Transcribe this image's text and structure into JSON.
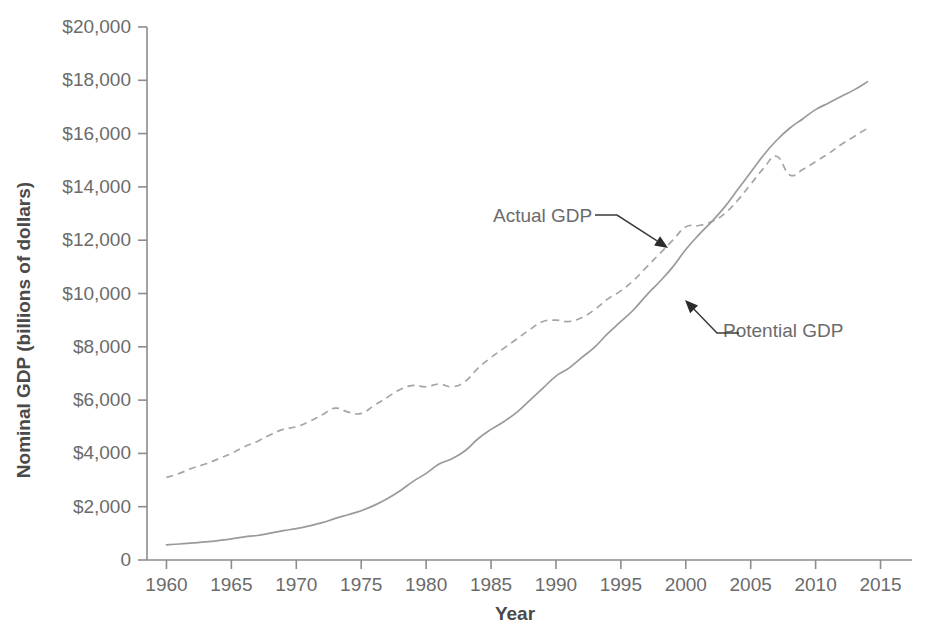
{
  "chart_data": {
    "type": "line",
    "title": "",
    "xlabel": "Year",
    "ylabel": "Nominal GDP (billions of dollars)",
    "xlim": [
      1958.5,
      2016.5
    ],
    "ylim": [
      0,
      20000
    ],
    "xticks": [
      "1960",
      "1965",
      "1970",
      "1975",
      "1980",
      "1985",
      "1990",
      "1995",
      "2000",
      "2005",
      "2010",
      "2015"
    ],
    "xtick_values": [
      1960,
      1965,
      1970,
      1975,
      1980,
      1985,
      1990,
      1995,
      2000,
      2005,
      2010,
      2015
    ],
    "yticks": [
      "0",
      "$2,000",
      "$4,000",
      "$6,000",
      "$8,000",
      "$10,000",
      "$12,000",
      "$14,000",
      "$16,000",
      "$18,000",
      "$20,000"
    ],
    "ytick_values": [
      0,
      2000,
      4000,
      6000,
      8000,
      10000,
      12000,
      14000,
      16000,
      18000,
      20000
    ],
    "grid": false,
    "legend_position": "inline-annotation",
    "x": [
      1960,
      1961,
      1962,
      1963,
      1964,
      1965,
      1966,
      1967,
      1968,
      1969,
      1970,
      1971,
      1972,
      1973,
      1974,
      1975,
      1976,
      1977,
      1978,
      1979,
      1980,
      1981,
      1982,
      1983,
      1984,
      1985,
      1986,
      1987,
      1988,
      1989,
      1990,
      1991,
      1992,
      1993,
      1994,
      1995,
      1996,
      1997,
      1998,
      1999,
      2000,
      2001,
      2002,
      2003,
      2004,
      2005,
      2006,
      2007,
      2008,
      2009,
      2010,
      2011,
      2012,
      2013,
      2014
    ],
    "series": [
      {
        "name": "Actual GDP",
        "style": "dashed",
        "color": "#a5a5a5",
        "values": [
          3100,
          3250,
          3450,
          3600,
          3800,
          4000,
          4250,
          4450,
          4700,
          4900,
          5000,
          5200,
          5450,
          5700,
          5550,
          5500,
          5800,
          6100,
          6400,
          6550,
          6500,
          6600,
          6500,
          6700,
          7200,
          7600,
          7950,
          8300,
          8650,
          8950,
          9000,
          8950,
          9100,
          9400,
          9800,
          10100,
          10500,
          11000,
          11500,
          12000,
          12500,
          12550,
          12700,
          13000,
          13500,
          14100,
          14700,
          15150,
          14450,
          14650,
          14950,
          15250,
          15600,
          15900,
          16200
        ]
      },
      {
        "name": "Potential GDP",
        "style": "solid",
        "color": "#9a9a9a",
        "values": [
          570,
          600,
          640,
          680,
          730,
          790,
          870,
          920,
          1010,
          1100,
          1180,
          1280,
          1400,
          1560,
          1700,
          1850,
          2050,
          2300,
          2600,
          2950,
          3250,
          3600,
          3800,
          4100,
          4550,
          4900,
          5200,
          5550,
          6000,
          6450,
          6900,
          7200,
          7600,
          8000,
          8500,
          8950,
          9400,
          9950,
          10450,
          11000,
          11650,
          12200,
          12700,
          13250,
          13900,
          14550,
          15200,
          15750,
          16200,
          16550,
          16900,
          17150,
          17400,
          17650,
          17950
        ]
      }
    ],
    "annotations": [
      {
        "id": "actual-gdp-annotation",
        "text": "Actual GDP",
        "label_x": 493,
        "label_y": 222,
        "leader_from_x": 617,
        "leader_from_y": 215,
        "leader_to_x": 668,
        "leader_to_y": 248
      },
      {
        "id": "potential-gdp-annotation",
        "text": "Potential GDP",
        "label_x": 723,
        "label_y": 337,
        "leader_from_x": 717,
        "leader_from_y": 333,
        "leader_to_x": 685,
        "leader_to_y": 300
      }
    ]
  },
  "colors": {
    "background": "#ffffff",
    "axis": "#8c8c8c",
    "text": "#6b6b6b",
    "title_text": "#4a4a4a",
    "actual_gdp_line": "#a5a5a5",
    "potential_gdp_line": "#9a9a9a",
    "annotation_arrow": "#2b2b2b"
  }
}
